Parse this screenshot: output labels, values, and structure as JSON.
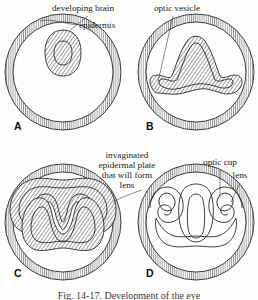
{
  "figure": {
    "title_caption": "Fig. 14-17.  Development of the eye",
    "caption_visible": "partially cut off at bottom edge",
    "background_color": "#fdfdfb",
    "ink_color": "#1d1d1d",
    "hatch_color": "#555555"
  },
  "panels": [
    {
      "letter": "A",
      "stage_name": "neural-tube-stage",
      "letter_x": 14,
      "letter_y": 130,
      "circle": {
        "cx": 63,
        "cy": 72,
        "r": 55
      },
      "structures": [
        "epidermis",
        "developing brain"
      ]
    },
    {
      "letter": "B",
      "stage_name": "optic-vesicle-stage",
      "letter_x": 146,
      "letter_y": 130,
      "circle": {
        "cx": 196,
        "cy": 72,
        "r": 55
      },
      "structures": [
        "epidermis",
        "optic vesicle"
      ]
    },
    {
      "letter": "C",
      "stage_name": "lens-placode-invagination-stage",
      "letter_x": 14,
      "letter_y": 277,
      "circle": {
        "cx": 63,
        "cy": 222,
        "r": 55
      },
      "structures": [
        "invaginated epidermal plate that will form lens"
      ]
    },
    {
      "letter": "D",
      "stage_name": "optic-cup-lens-stage",
      "letter_x": 146,
      "letter_y": 277,
      "circle": {
        "cx": 196,
        "cy": 222,
        "r": 55
      },
      "structures": [
        "optic cup",
        "lens"
      ]
    }
  ],
  "labels": {
    "developing_brain": {
      "text": "developing brain",
      "x": 52,
      "y": 11,
      "anchor": "start"
    },
    "epidermis": {
      "text": "epidermis",
      "x": 79,
      "y": 28,
      "anchor": "start"
    },
    "optic_vesicle": {
      "text": "optic vesicle",
      "x": 177,
      "y": 11,
      "anchor": "middle"
    },
    "invaginated_line1": {
      "text": "invaginated",
      "x": 127,
      "y": 158,
      "anchor": "middle"
    },
    "invaginated_line2": {
      "text": "epidermal plate",
      "x": 127,
      "y": 168,
      "anchor": "middle"
    },
    "invaginated_line3": {
      "text": "that will form",
      "x": 127,
      "y": 178,
      "anchor": "middle"
    },
    "invaginated_line4": {
      "text": "lens",
      "x": 127,
      "y": 188,
      "anchor": "middle"
    },
    "optic_cup": {
      "text": "optic cup",
      "x": 220,
      "y": 165,
      "anchor": "middle"
    },
    "lens": {
      "text": "lens",
      "x": 240,
      "y": 178,
      "anchor": "middle"
    }
  }
}
